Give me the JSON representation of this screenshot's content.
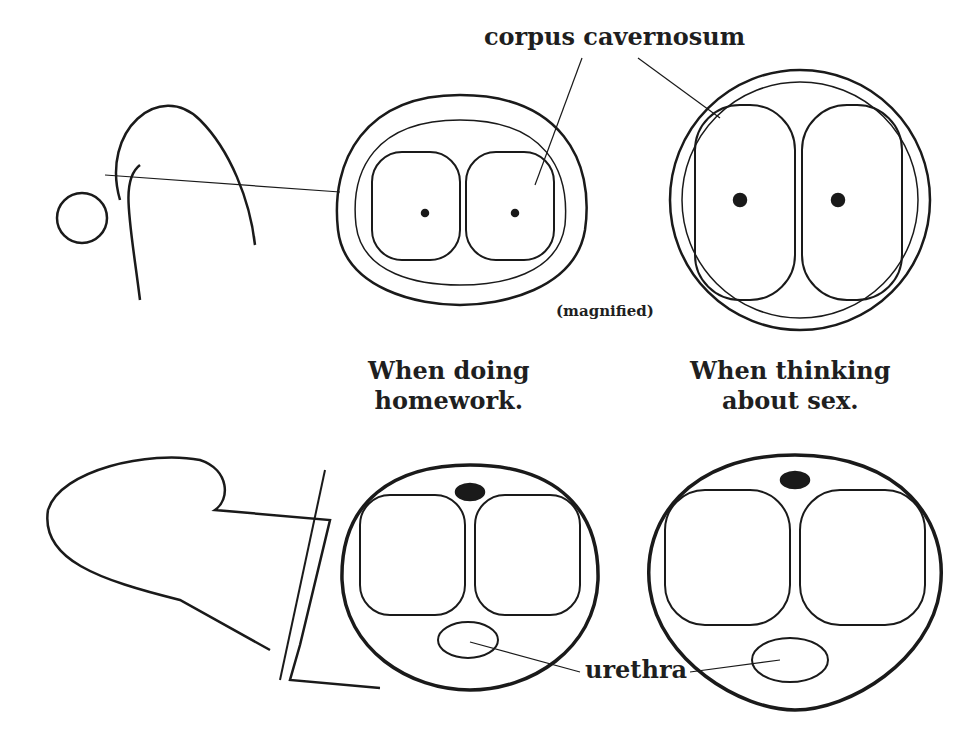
{
  "labels": {
    "top_label": "corpus cavernosum",
    "magnified": "(magnified)",
    "caption_left_line1": "When doing",
    "caption_left_line2": "homework.",
    "caption_right_line1": "When thinking",
    "caption_right_line2": "about sex.",
    "bottom_label": "urethra"
  },
  "colors": {
    "ink": "#1a1a1a",
    "background": "#ffffff"
  }
}
